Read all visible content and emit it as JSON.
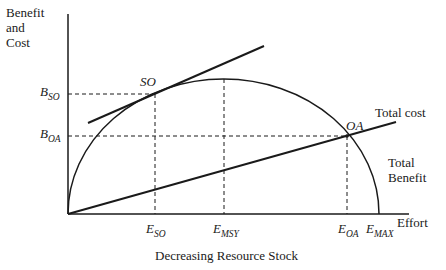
{
  "diagram": {
    "title": "",
    "y_axis_label": [
      "Benefit",
      "and",
      "Cost"
    ],
    "x_axis_label": "Effort",
    "caption": "Decreasing Resource Stock",
    "curves": {
      "total_benefit": [
        "Total",
        "Benefit"
      ],
      "total_cost": "Total cost"
    },
    "points": {
      "so": "SO",
      "oa": "OA"
    },
    "y_ticks": {
      "b_so": {
        "main": "B",
        "sub": "SO"
      },
      "b_oa": {
        "main": "B",
        "sub": "OA"
      }
    },
    "x_ticks": {
      "e_so": {
        "main": "E",
        "sub": "SO"
      },
      "e_msy": {
        "main": "E",
        "sub": "MSY"
      },
      "e_oa": {
        "main": "E",
        "sub": "OA"
      },
      "e_max": {
        "main": "E",
        "sub": "MAX"
      }
    },
    "colors": {
      "line": "#1a1a1a",
      "background": "#ffffff"
    }
  }
}
